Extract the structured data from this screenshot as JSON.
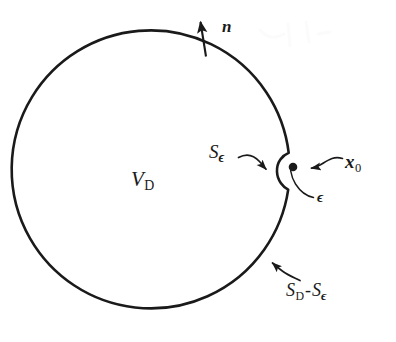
{
  "figure": {
    "kind": "geometry-diagram",
    "background_color": "#ffffff",
    "stroke_color": "#1a1a1a",
    "boundary": {
      "shape": "circle",
      "center_x": 160,
      "center_y": 186,
      "radius": 139,
      "stroke_width": 2.6
    },
    "notch": {
      "shape": "semicircular-cusp",
      "center_x": 289,
      "center_y": 170,
      "radius": 18,
      "opens": "right"
    },
    "point_marker": {
      "name": "x0-point",
      "cx": 293,
      "cy": 167,
      "r": 4.3,
      "fill": "#1a1a1a"
    }
  },
  "labels": {
    "normal_vector": "n",
    "volume": {
      "symbol": "V",
      "subscript": "D"
    },
    "epsilon_surface": {
      "symbol": "S",
      "subscript": "ϵ"
    },
    "singular_point": {
      "symbol": "x",
      "subscript": "0"
    },
    "epsilon_radius": "ϵ",
    "remaining_surface": {
      "first_symbol": "S",
      "first_subscript": "D",
      "operator": "-",
      "second_symbol": "S",
      "second_subscript": "ϵ"
    }
  },
  "annotations": {
    "normal_arrow": "arrow pointing outward (up, slightly left) from the top of the circle",
    "se_leader": "curved arrow from the S-epsilon label rightward into the notch",
    "x0_leader": "curved arrow from the x-zero label leftward to the black point",
    "eps_leader": "curved leader from the epsilon label up-left to the notch radius",
    "sdse_leader": "curved arrow from the S_D minus S_epsilon label up-left to the circle boundary"
  }
}
